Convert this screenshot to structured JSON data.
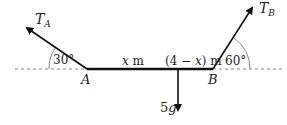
{
  "diagram": {
    "type": "statics-beam-forces",
    "forces": [
      {
        "label_main": "T",
        "label_sub": "A",
        "direction": "up-left",
        "angle_label": "30°",
        "point": "A"
      },
      {
        "label_main": "T",
        "label_sub": "B",
        "direction": "up-right",
        "angle_label": "60°",
        "point": "B"
      },
      {
        "label": "5g",
        "direction": "down"
      }
    ],
    "points": {
      "A": "A",
      "B": "B"
    },
    "segments": {
      "left": "x m",
      "left_var": "x",
      "left_unit": "m",
      "right_pre": "(4 − ",
      "right_var": "x",
      "right_post": ") m"
    },
    "colors": {
      "line": "#111111",
      "dashed": "#888888",
      "arc": "#666666"
    }
  }
}
